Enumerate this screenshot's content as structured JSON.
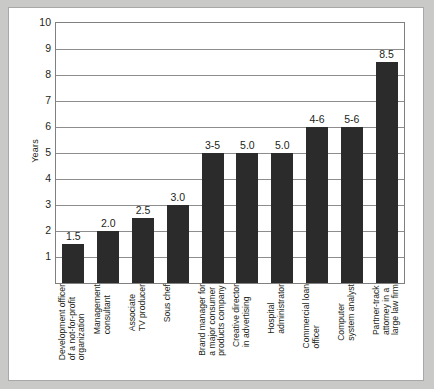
{
  "chart_data": {
    "type": "bar",
    "title": "",
    "subtitle": "",
    "xlabel": "",
    "ylabel": "Years",
    "ylim": [
      0,
      10
    ],
    "yticks": [
      10,
      9,
      8,
      7,
      6,
      5,
      4,
      3,
      2,
      1
    ],
    "grid": true,
    "legend": "none",
    "bar_color": "#2b2b2b",
    "categories": [
      "Development officer\nof a not-for-profit\norganization",
      "Management\nconsultant",
      "Associate\nTV producer",
      "Sous chef",
      "Brand manager for\na major consumer\nproducts company",
      "Creative director\nin advertising",
      "Hospital\nadministrator",
      "Commercial loan\nofficer",
      "Computer\nsystem analyst",
      "Partner-track\nattorney in a\nlarge law firm"
    ],
    "values": [
      1.5,
      2.0,
      2.5,
      3.0,
      5.0,
      5.0,
      5.0,
      6.0,
      6.0,
      8.5
    ],
    "value_labels": [
      "1.5",
      "2.0",
      "2.5",
      "3.0",
      "3-5",
      "5.0",
      "5.0",
      "4-6",
      "5-6",
      "8.5"
    ]
  }
}
